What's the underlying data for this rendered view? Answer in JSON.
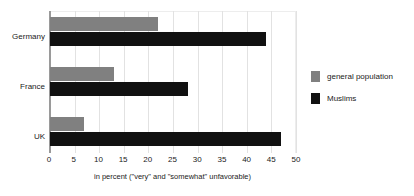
{
  "chart_data": {
    "type": "bar",
    "orientation": "horizontal",
    "title": "",
    "subtitle": "",
    "categories": [
      "Germany",
      "France",
      "UK"
    ],
    "series": [
      {
        "name": "general population",
        "color": "#808080",
        "values": [
          22,
          13,
          7
        ]
      },
      {
        "name": "Muslims",
        "color": "#111111",
        "values": [
          44,
          28,
          47
        ]
      }
    ],
    "xlabel": "in percent (\"very\" and \"somewhat\" unfavorable)",
    "ylabel": "",
    "xlim": [
      0,
      50
    ],
    "xticks": [
      0,
      5,
      10,
      15,
      20,
      25,
      30,
      35,
      40,
      45,
      50
    ],
    "xtick_labels": [
      "0",
      "5",
      "10",
      "15",
      "20",
      "25",
      "30",
      "35",
      "40",
      "45",
      "50"
    ],
    "grid": true,
    "grid_axis": "x",
    "legend_position": "right",
    "background_color": "#ffffff"
  }
}
